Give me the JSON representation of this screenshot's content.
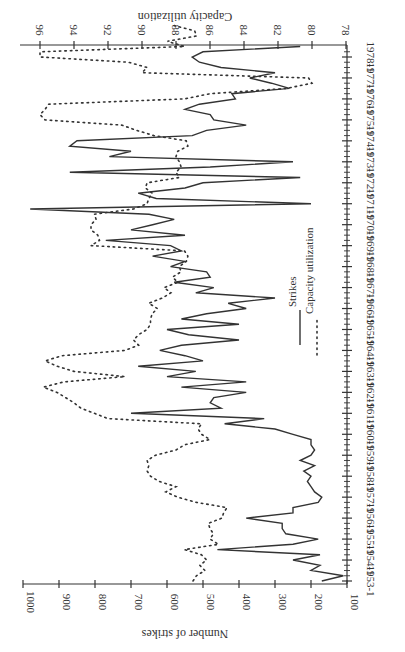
{
  "chart_data": {
    "type": "line",
    "orientation": "rotated-90-clockwise",
    "title": "",
    "x_label": "",
    "y_label_left": "Number of strikes",
    "y_label_right": "Capacity utilization",
    "x_ticks": [
      "1953-1",
      "1954-1",
      "1955-1",
      "1956-1",
      "1957-1",
      "1958-1",
      "1959-1",
      "1960-1",
      "1961-1",
      "1962-1",
      "1963-1",
      "1964-1",
      "1965-1",
      "1966-1",
      "1967-1",
      "1968-1",
      "1969-1",
      "1970-1",
      "1971-1",
      "1972-1",
      "1973-1",
      "1974-1",
      "1975-1",
      "1976-1",
      "1977-1",
      "1978-1"
    ],
    "strikes_axis": {
      "ticks": [
        100,
        200,
        300,
        400,
        500,
        600,
        700,
        800,
        900,
        1000
      ],
      "range": [
        100,
        1000
      ]
    },
    "capacity_axis": {
      "ticks": [
        78,
        80,
        82,
        84,
        86,
        88,
        90,
        92,
        94,
        96
      ],
      "range": [
        78,
        96.5
      ]
    },
    "legend": [
      "Strikes",
      "Capacity utilization"
    ],
    "series": [
      {
        "name": "Strikes",
        "style": "solid",
        "axis": "left",
        "values": [
          170,
          110,
          200,
          175,
          250,
          175,
          460,
          250,
          180,
          270,
          280,
          280,
          380,
          250,
          250,
          180,
          170,
          190,
          200,
          210,
          200,
          220,
          190,
          230,
          200,
          190,
          200,
          200,
          250,
          300,
          440,
          330,
          700,
          450,
          480,
          470,
          380,
          560,
          380,
          600,
          520,
          680,
          500,
          550,
          620,
          560,
          400,
          540,
          600,
          400,
          560,
          490,
          380,
          430,
          300,
          520,
          470,
          580,
          480,
          490,
          590,
          550,
          640,
          560,
          590,
          770,
          550,
          700,
          640,
          580,
          650,
          980,
          200,
          630,
          680,
          550,
          500,
          230,
          870,
          480,
          250,
          760,
          700,
          870,
          850,
          530,
          490,
          380,
          470,
          480,
          550,
          510,
          410,
          420,
          260,
          310,
          370,
          300,
          450,
          510,
          530,
          500,
          230
        ]
      },
      {
        "name": "Capacity utilization",
        "style": "dotted",
        "axis": "right",
        "values": [
          87.0,
          86.8,
          86.3,
          86.6,
          86.2,
          86.5,
          87.5,
          85.5,
          86.0,
          85.8,
          86.0,
          86.1,
          85.3,
          85.2,
          85.0,
          86.8,
          87.9,
          88.6,
          88.0,
          89.0,
          89.5,
          89.7,
          89.6,
          89.7,
          89.2,
          88.0,
          87.5,
          86.0,
          86.5,
          86.7,
          86.5,
          92.0,
          92.8,
          93.6,
          94.0,
          94.5,
          95.0,
          95.8,
          94.6,
          91.0,
          94.0,
          95.0,
          95.7,
          94.7,
          91.0,
          90.2,
          90.5,
          90.2,
          89.7,
          89.5,
          89.5,
          89.4,
          89.1,
          89.6,
          88.8,
          88.3,
          88.7,
          87.9,
          88.2,
          87.7,
          87.8,
          87.4,
          87.3,
          87.5,
          93.0,
          92.5,
          92.6,
          93.0,
          93.0,
          92.7,
          92.8,
          90.5,
          89.7,
          89.6,
          89.4,
          89.8,
          89.7,
          87.8,
          88.0,
          87.7,
          87.8,
          88.0,
          87.9,
          87.3,
          87.4,
          89.3,
          90.3,
          91.2,
          95.7,
          96.0,
          95.7,
          95.5,
          87.5,
          86.0,
          81.5,
          80.0,
          80.2,
          90.0,
          89.7,
          90.8,
          96.0,
          96.0,
          87.5,
          88.5,
          86.8,
          86.9,
          88.1
        ]
      }
    ]
  }
}
